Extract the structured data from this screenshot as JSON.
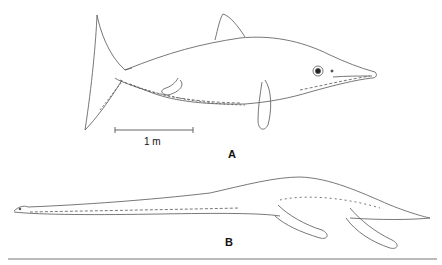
{
  "figure": {
    "panels": [
      {
        "id": "A",
        "label": "A",
        "subject": "ichthyosaur-illustration"
      },
      {
        "id": "B",
        "label": "B",
        "subject": "plesiosaur-illustration"
      }
    ],
    "scale_bar": {
      "label": "1 m"
    },
    "colors": {
      "ink": "#555555",
      "background": "#ffffff",
      "rule": "#777777"
    }
  }
}
